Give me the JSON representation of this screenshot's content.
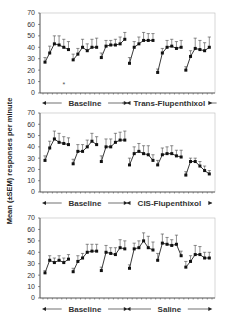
{
  "chart_data": [
    {
      "type": "line",
      "title": "",
      "ylabel": "Mean (±SEM) responses per minute",
      "xlabel": "",
      "ylim": [
        0,
        70
      ],
      "yticks": [
        0,
        10,
        20,
        30,
        40,
        50,
        60,
        70
      ],
      "phases": [
        {
          "label": "Baseline",
          "sessions": [
            0,
            1,
            2
          ]
        },
        {
          "label": "Trans-Flupenthixol",
          "sessions": [
            3,
            4,
            5
          ]
        }
      ],
      "annotations": [
        {
          "text": "*",
          "session": 0,
          "point": 4,
          "y": 8
        }
      ],
      "series": [
        {
          "name": "Session 1",
          "values": [
            27,
            35,
            43,
            42,
            40,
            38
          ],
          "sem": [
            4,
            6,
            7,
            8,
            7,
            7
          ]
        },
        {
          "name": "Session 2",
          "values": [
            29,
            34,
            40,
            37,
            40,
            40
          ],
          "sem": [
            5,
            5,
            7,
            6,
            7,
            8
          ]
        },
        {
          "name": "Session 3",
          "values": [
            31,
            41,
            42,
            42,
            43,
            47
          ],
          "sem": [
            4,
            5,
            4,
            5,
            6,
            6
          ]
        },
        {
          "name": "Session 4",
          "values": [
            26,
            40,
            43,
            46,
            46,
            46
          ],
          "sem": [
            5,
            5,
            6,
            7,
            6,
            6
          ]
        },
        {
          "name": "Session 5",
          "values": [
            18,
            35,
            40,
            41,
            39,
            40
          ],
          "sem": [
            3,
            4,
            6,
            6,
            6,
            6
          ]
        },
        {
          "name": "Session 6",
          "values": [
            20,
            32,
            39,
            38,
            37,
            40
          ],
          "sem": [
            3,
            5,
            9,
            8,
            7,
            9
          ]
        }
      ]
    },
    {
      "type": "line",
      "title": "",
      "ylabel": "Mean (±SEM) responses per minute",
      "xlabel": "",
      "ylim": [
        0,
        70
      ],
      "yticks": [
        0,
        10,
        20,
        30,
        40,
        50,
        60,
        70
      ],
      "phases": [
        {
          "label": "Baseline",
          "sessions": [
            0,
            1,
            2
          ]
        },
        {
          "label": "CIS-Flupenthixol",
          "sessions": [
            3,
            4,
            5
          ]
        }
      ],
      "series": [
        {
          "name": "Session 1",
          "values": [
            28,
            39,
            47,
            44,
            43,
            42
          ],
          "sem": [
            4,
            6,
            7,
            8,
            6,
            6
          ]
        },
        {
          "name": "Session 2",
          "values": [
            25,
            36,
            36,
            40,
            45,
            42
          ],
          "sem": [
            4,
            6,
            6,
            6,
            7,
            7
          ]
        },
        {
          "name": "Session 3",
          "values": [
            27,
            40,
            40,
            44,
            46,
            46
          ],
          "sem": [
            5,
            7,
            7,
            8,
            7,
            8
          ]
        },
        {
          "name": "Session 4",
          "values": [
            24,
            34,
            36,
            34,
            33,
            28
          ],
          "sem": [
            6,
            6,
            7,
            7,
            8,
            5
          ]
        },
        {
          "name": "Session 5",
          "values": [
            24,
            33,
            34,
            34,
            32,
            31
          ],
          "sem": [
            4,
            6,
            6,
            7,
            5,
            6
          ]
        },
        {
          "name": "Session 6",
          "values": [
            15,
            27,
            27,
            23,
            19,
            16
          ],
          "sem": [
            3,
            3,
            3,
            4,
            4,
            3
          ]
        }
      ]
    },
    {
      "type": "line",
      "title": "",
      "ylabel": "Mean (±SEM) responses per minute",
      "xlabel": "",
      "ylim": [
        0,
        70
      ],
      "yticks": [
        0,
        10,
        20,
        30,
        40,
        50,
        60,
        70
      ],
      "phases": [
        {
          "label": "Baseline",
          "sessions": [
            0,
            1,
            2
          ]
        },
        {
          "label": "Saline",
          "sessions": [
            3,
            4,
            5
          ]
        }
      ],
      "series": [
        {
          "name": "Session 1",
          "values": [
            22,
            33,
            31,
            33,
            31,
            34
          ],
          "sem": [
            2,
            4,
            4,
            4,
            4,
            4
          ]
        },
        {
          "name": "Session 2",
          "values": [
            23,
            32,
            35,
            40,
            41,
            41
          ],
          "sem": [
            3,
            5,
            4,
            7,
            6,
            6
          ]
        },
        {
          "name": "Session 3",
          "values": [
            24,
            40,
            39,
            38,
            44,
            43
          ],
          "sem": [
            3,
            6,
            5,
            6,
            7,
            7
          ]
        },
        {
          "name": "Session 4",
          "values": [
            26,
            43,
            44,
            50,
            44,
            42
          ],
          "sem": [
            3,
            5,
            6,
            7,
            10,
            7
          ]
        },
        {
          "name": "Session 5",
          "values": [
            33,
            48,
            47,
            46,
            47,
            37
          ],
          "sem": [
            6,
            8,
            6,
            5,
            8,
            4
          ]
        },
        {
          "name": "Session 6",
          "values": [
            27,
            32,
            38,
            38,
            35,
            35
          ],
          "sem": [
            5,
            5,
            8,
            7,
            5,
            5
          ]
        }
      ]
    }
  ],
  "axis": {
    "ylabel": "Mean (±SEM) responses per minute"
  }
}
